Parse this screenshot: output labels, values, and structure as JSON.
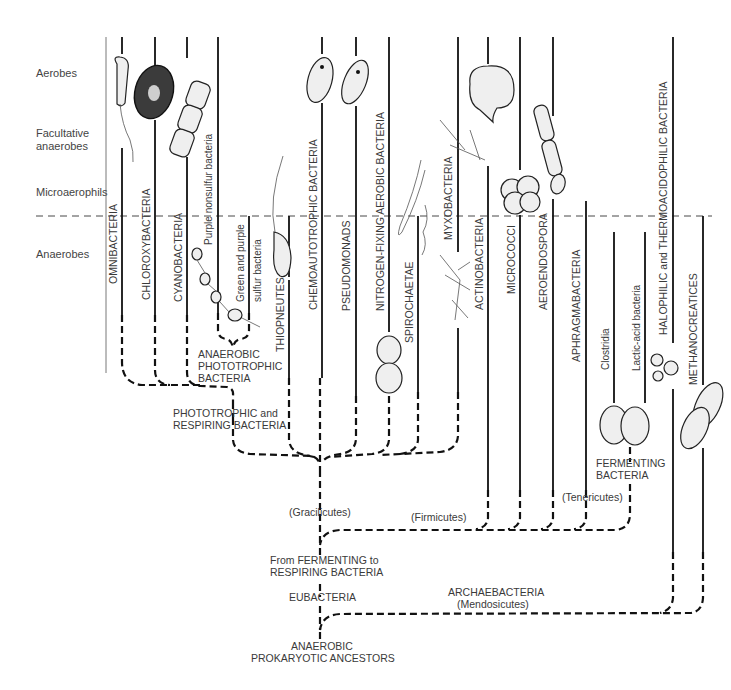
{
  "diagram": {
    "type": "phylogenetic-tree",
    "oxygen_zones": [
      {
        "id": "aerobes",
        "label": "Aerobes"
      },
      {
        "id": "facultative-1",
        "label": "Facultative"
      },
      {
        "id": "facultative-2",
        "label": "anaerobes"
      },
      {
        "id": "microaerophils",
        "label": "Microaerophils"
      },
      {
        "id": "anaerobes",
        "label": "Anaerobes"
      }
    ],
    "lineages": [
      {
        "id": "omnibacteria",
        "label": "OMNIBACTERIA"
      },
      {
        "id": "chloroxybacteria",
        "label": "CHLOROXYBACTERIA"
      },
      {
        "id": "cyanobacteria",
        "label": "CYANOBACTERIA"
      },
      {
        "id": "purple-nonsulfur",
        "label": "Purple nonsulfur bacteria"
      },
      {
        "id": "green-purple-sulfur-1",
        "label": "Green and purple"
      },
      {
        "id": "green-purple-sulfur-2",
        "label": "sulfur bacteria"
      },
      {
        "id": "thiopneutes",
        "label": "THIOPNEUTES"
      },
      {
        "id": "chemoautotrophic",
        "label": "CHEMOAUTOTROPHIC BACTERIA"
      },
      {
        "id": "pseudomonads",
        "label": "PSEUDOMONADS"
      },
      {
        "id": "nitrogen-fixing",
        "label": "NITROGEN-FIXING AEROBIC BACTERIA"
      },
      {
        "id": "spirochaetae",
        "label": "SPIROCHAETAE"
      },
      {
        "id": "myxobacteria",
        "label": "MYXOBACTERIA"
      },
      {
        "id": "actinobacteria",
        "label": "ACTINOBACTERIA"
      },
      {
        "id": "micrococci",
        "label": "MICROCOCCI"
      },
      {
        "id": "aeroendospora",
        "label": "AEROENDOSPORA"
      },
      {
        "id": "aphragmabacteria",
        "label": "APHRAGMABACTERIA"
      },
      {
        "id": "clostridia",
        "label": "Clostridia"
      },
      {
        "id": "lactic-acid",
        "label": "Lactic-acid bacteria"
      },
      {
        "id": "halophilic",
        "label": "HALOPHILIC and THERMOACIDOPHILIC BACTERIA"
      },
      {
        "id": "methanocreatices",
        "label": "METHANOCREATICES"
      }
    ],
    "nodes": {
      "anaerobic_phototrophic": [
        "ANAEROBIC",
        "PHOTOTROPHIC",
        "BACTERIA"
      ],
      "phototrophic_respiring": [
        "PHOTOTROPHIC and",
        "RESPIRING BACTERIA"
      ],
      "gracilicutes": "(Gracilicutes)",
      "firmicutes": "(Firmicutes)",
      "tenericutes": "(Tenericutes)",
      "fermenting": [
        "FERMENTING",
        "BACTERIA"
      ],
      "fermenting_to_respiring": [
        "From FERMENTING to",
        "RESPIRING BACTERIA"
      ],
      "eubacteria": "EUBACTERIA",
      "archaebacteria": [
        "ARCHAEBACTERIA",
        "(Mendosicutes)"
      ],
      "ancestors": [
        "ANAEROBIC",
        "PROKARYOTIC ANCESTORS"
      ]
    }
  }
}
